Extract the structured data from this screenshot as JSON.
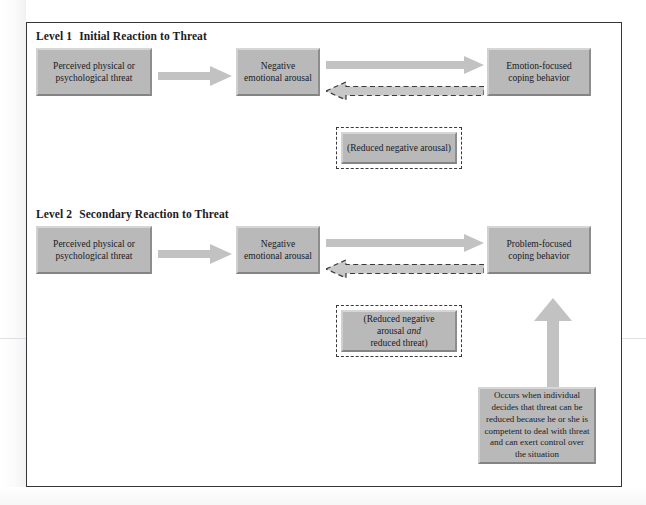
{
  "figure": {
    "accent_box_fill": "#b9b9b9",
    "frame_color": "#35363a",
    "arrow_color": "#c2c2c2"
  },
  "levels": [
    {
      "id": "level-1",
      "number_label": "Level 1",
      "title": "Initial Reaction to Threat",
      "source_box": "Perceived physical or psychological threat",
      "middle_box": "Negative emotional arousal",
      "outcome_box": "Emotion-focused coping behavior",
      "feedback_box": "(Reduced negative arousal)"
    },
    {
      "id": "level-2",
      "number_label": "Level 2",
      "title": "Secondary Reaction to Threat",
      "source_box": "Perceived physical or psychological threat",
      "middle_box": "Negative emotional arousal",
      "outcome_box": "Problem-focused coping behavior",
      "feedback_box_line1": "(Reduced negative",
      "feedback_box_line2_pre": "arousal ",
      "feedback_box_line2_em": "and",
      "feedback_box_line3": "reduced threat)",
      "condition_box": "Occurs when individual decides that threat can be reduced because he or she is competent to deal with threat and can exert control over the situation"
    }
  ],
  "icons": {
    "forward_arrow": "arrow-right-icon",
    "feedback_arrow": "dashed-arrow-left-icon",
    "upward_arrow": "arrow-up-icon"
  }
}
